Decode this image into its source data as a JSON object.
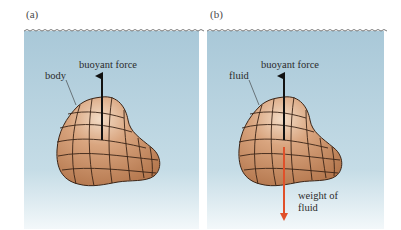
{
  "figure": {
    "panels": [
      {
        "id": "a",
        "label": "(a)",
        "body_label": "body",
        "up_arrow_label": "buoyant force"
      },
      {
        "id": "b",
        "label": "(b)",
        "body_label": "fluid",
        "up_arrow_label": "buoyant force",
        "down_arrow_label_line1": "weight of",
        "down_arrow_label_line2": "fluid"
      }
    ],
    "colors": {
      "water_top": "#a9c8d8",
      "water_bottom": "#f3f8fa",
      "body_light": "#f3dcc6",
      "body_dark": "#b07248",
      "grid_line": "#3a2416",
      "buoyant_arrow": "#111111",
      "weight_arrow": "#e0502a"
    }
  }
}
